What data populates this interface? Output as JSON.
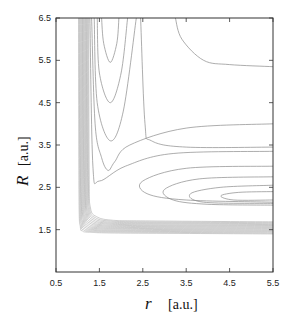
{
  "chart_data": {
    "type": "contour",
    "title": "",
    "xlabel": "r",
    "xlabel_unit": "[a.u.]",
    "ylabel": "R",
    "ylabel_unit": "[a.u.]",
    "xlim": [
      0.5,
      5.5
    ],
    "ylim": [
      0.5,
      6.5
    ],
    "x_ticks": [
      "0.5",
      "1.5",
      "2.5",
      "3.5",
      "4.5",
      "5.5"
    ],
    "y_ticks": [
      "1.5",
      "2.5",
      "3.5",
      "4.5",
      "5.5",
      "6.5"
    ],
    "grid": false,
    "legend": null,
    "line_color": "#8a8a8a",
    "contours": [
      {
        "kind": "u",
        "points": [
          [
            1.55,
            6.5
          ],
          [
            1.6,
            5.9
          ],
          [
            1.75,
            5.45
          ],
          [
            1.9,
            5.9
          ],
          [
            1.95,
            6.5
          ]
        ]
      },
      {
        "kind": "u",
        "points": [
          [
            1.45,
            6.5
          ],
          [
            1.5,
            5.2
          ],
          [
            1.75,
            4.5
          ],
          [
            2.0,
            5.2
          ],
          [
            2.15,
            6.5
          ]
        ]
      },
      {
        "kind": "u",
        "points": [
          [
            1.38,
            6.5
          ],
          [
            1.45,
            4.5
          ],
          [
            1.75,
            3.6
          ],
          [
            2.05,
            4.3
          ],
          [
            2.35,
            6.5
          ]
        ]
      },
      {
        "kind": "u",
        "points": [
          [
            1.32,
            6.5
          ],
          [
            1.4,
            4.0
          ],
          [
            1.55,
            3.2
          ],
          [
            1.7,
            2.9
          ],
          [
            1.85,
            3.1
          ],
          [
            2.2,
            3.5
          ],
          [
            3.5,
            3.9
          ],
          [
            5.5,
            4.0
          ]
        ]
      },
      {
        "kind": "h",
        "points": [
          [
            1.28,
            6.5
          ],
          [
            1.35,
            3.0
          ],
          [
            1.5,
            2.65
          ],
          [
            2.1,
            3.0
          ],
          [
            3.2,
            3.3
          ],
          [
            5.5,
            3.35
          ]
        ]
      },
      {
        "kind": "h",
        "points": [
          [
            2.45,
            6.5
          ],
          [
            2.55,
            4.0
          ],
          [
            2.7,
            3.6
          ],
          [
            3.5,
            3.45
          ],
          [
            5.5,
            3.45
          ]
        ]
      },
      {
        "kind": "h",
        "points": [
          [
            3.25,
            6.5
          ],
          [
            3.4,
            6.0
          ],
          [
            3.9,
            5.5
          ],
          [
            4.5,
            5.4
          ],
          [
            5.5,
            5.35
          ]
        ]
      },
      {
        "kind": "well",
        "points": [
          [
            5.5,
            3.0
          ],
          [
            3.5,
            2.95
          ],
          [
            2.5,
            2.65
          ],
          [
            2.6,
            2.35
          ],
          [
            3.5,
            2.2
          ],
          [
            5.5,
            2.15
          ]
        ]
      },
      {
        "kind": "well",
        "points": [
          [
            5.5,
            2.75
          ],
          [
            3.8,
            2.7
          ],
          [
            3.0,
            2.45
          ],
          [
            3.2,
            2.2
          ],
          [
            4.0,
            2.1
          ],
          [
            5.5,
            2.08
          ]
        ]
      },
      {
        "kind": "well",
        "points": [
          [
            5.5,
            2.55
          ],
          [
            4.3,
            2.5
          ],
          [
            3.6,
            2.35
          ],
          [
            3.9,
            2.15
          ],
          [
            5.5,
            2.12
          ]
        ]
      },
      {
        "kind": "well",
        "points": [
          [
            5.5,
            2.4
          ],
          [
            4.7,
            2.38
          ],
          [
            4.3,
            2.3
          ],
          [
            4.6,
            2.2
          ],
          [
            5.5,
            2.2
          ]
        ]
      }
    ],
    "wall_contours": {
      "count": 14,
      "r_start": 1.02,
      "r_step": 0.018,
      "R_start": 1.42,
      "R_step": 0.022
    }
  }
}
